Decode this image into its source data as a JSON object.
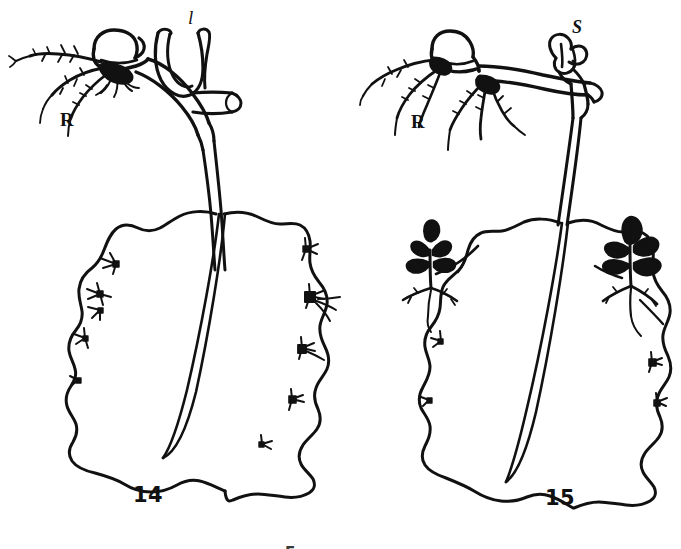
{
  "plate": {
    "kind": "botanical-line-drawing",
    "medium": "black ink on white paper (scanned halftone)",
    "width": 681,
    "height": 549,
    "background_color": "#ffffff",
    "ink_color": "#111111",
    "subject": "Leaf-propagating plant: detached leaf bearing marginal plantlets"
  },
  "figures": [
    {
      "id": "figure-14",
      "number": "14",
      "number_position": {
        "x": 133,
        "y": 497
      },
      "description": "Leaf with rhizome-like stem segment at top, root cluster at left, a looped young leaf and a cut stem stub at right; leaf blade below with numerous small marginal bud scars",
      "labels": [
        {
          "id": "label-l",
          "text": "l",
          "meaning": "leaf",
          "position": {
            "x": 188,
            "y": 12
          },
          "style": "italic"
        },
        {
          "id": "label-R",
          "text": "R",
          "meaning": "roots",
          "position": {
            "x": 60,
            "y": 113
          },
          "style": "bold"
        }
      ],
      "marginal_buds_count": 9,
      "plantlets_count": 0
    },
    {
      "id": "figure-15",
      "number": "15",
      "number_position": {
        "x": 545,
        "y": 500
      },
      "description": "Leaf with horizontal rhizome at top, root cluster at left, an emerging shoot bud at right; leaf blade below bearing two well-developed plantlets with leaves and roots on its margins",
      "labels": [
        {
          "id": "label-S",
          "text": "S",
          "meaning": "shoot",
          "position": {
            "x": 572,
            "y": 22
          },
          "style": "bold-italic"
        },
        {
          "id": "label-R",
          "text": "R",
          "meaning": "roots",
          "position": {
            "x": 411,
            "y": 115
          },
          "style": "bold"
        }
      ],
      "marginal_buds_count": 4,
      "plantlets_count": 2,
      "plantlets": [
        {
          "id": "plantlet-left",
          "position": {
            "x": 412,
            "y": 240
          },
          "leaves": 4,
          "has_roots": true
        },
        {
          "id": "plantlet-right",
          "position": {
            "x": 600,
            "y": 230
          },
          "leaves": 5,
          "has_roots": true
        }
      ]
    }
  ],
  "caption": {
    "id": "caption-cropped",
    "text": "F",
    "note": "Only the very top edge of the caption line is visible at the bottom of the crop",
    "position": {
      "x": 285,
      "y": 543
    }
  }
}
